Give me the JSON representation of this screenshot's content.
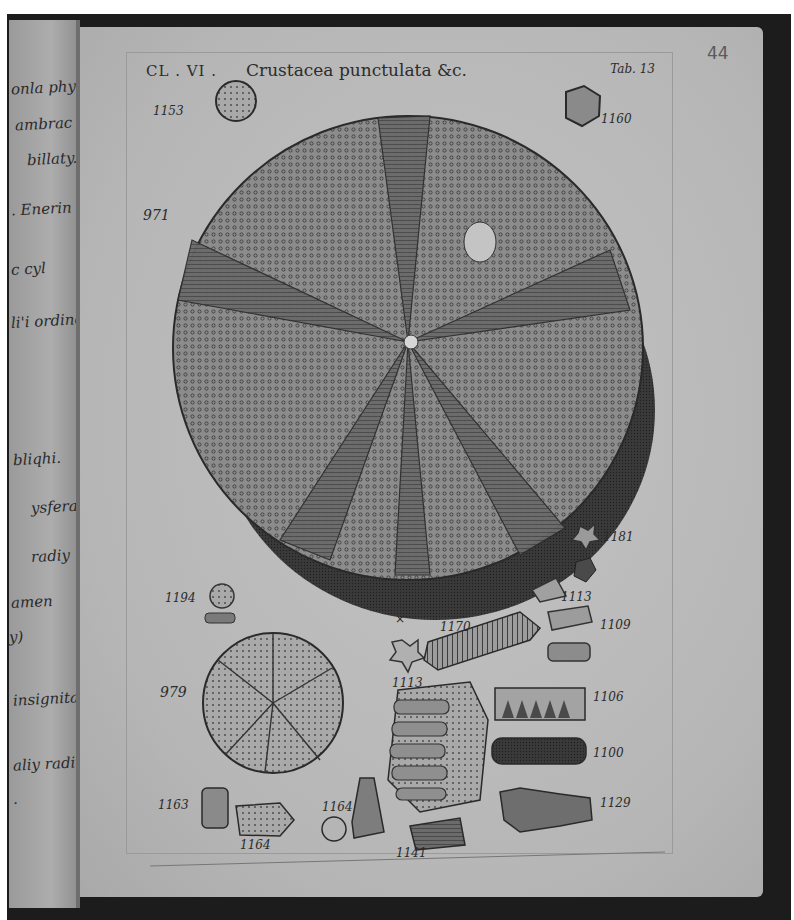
{
  "page": {
    "page_number": "44",
    "left_page_margin_notes": [
      "onla phylopt",
      "ambrac",
      "billaty.",
      ". Enerin",
      "c cyl",
      "li'i ordine",
      "bliqhi.",
      "ysfera",
      "radiy",
      "amen",
      "y)",
      "insignita",
      "aliy radii",
      "."
    ]
  },
  "plate": {
    "class_label": "CL . VI .",
    "title": "Crustacea punctulata &c.",
    "table_label": "Tab. 13",
    "figures": [
      {
        "id": "1153",
        "label": "1153",
        "description": "small round echinoid"
      },
      {
        "id": "1160",
        "label": "1160",
        "description": "small rounded fossil"
      },
      {
        "id": "971",
        "label": "971",
        "description": "large sea urchin test, top view"
      },
      {
        "id": "1181",
        "label": "1181",
        "description": "star-shaped fragment"
      },
      {
        "id": "1113a",
        "label": "1113",
        "description": "spine fragment"
      },
      {
        "id": "1194",
        "label": "1194",
        "description": "small button-like fossil on base"
      },
      {
        "id": "x",
        "label": "×",
        "description": "mark"
      },
      {
        "id": "1170",
        "label": "1170",
        "description": "ribbed spine"
      },
      {
        "id": "1109",
        "label": "1109",
        "description": "spine fragment"
      },
      {
        "id": "1113b",
        "label": "1113",
        "description": "star-shaped columnal"
      },
      {
        "id": "979",
        "label": "979",
        "description": "smaller sea urchin test"
      },
      {
        "id": "1106",
        "label": "1106",
        "description": "jaw-like fragment"
      },
      {
        "id": "1100",
        "label": "1100",
        "description": "encrusted fragment"
      },
      {
        "id": "1129",
        "label": "1129",
        "description": "segmented fossil"
      },
      {
        "id": "1163",
        "label": "1163",
        "description": "cylindrical fragment"
      },
      {
        "id": "1164a",
        "label": "1164",
        "description": "reticulated fragment"
      },
      {
        "id": "1164b",
        "label": "1164",
        "description": "club-shaped spine and cross-section"
      },
      {
        "id": "1141",
        "label": "1141",
        "description": "flat fragment"
      }
    ]
  },
  "colors": {
    "paper": "#b9b9b9",
    "ink": "#2b2b2b",
    "frame": "#1c1c1c"
  }
}
